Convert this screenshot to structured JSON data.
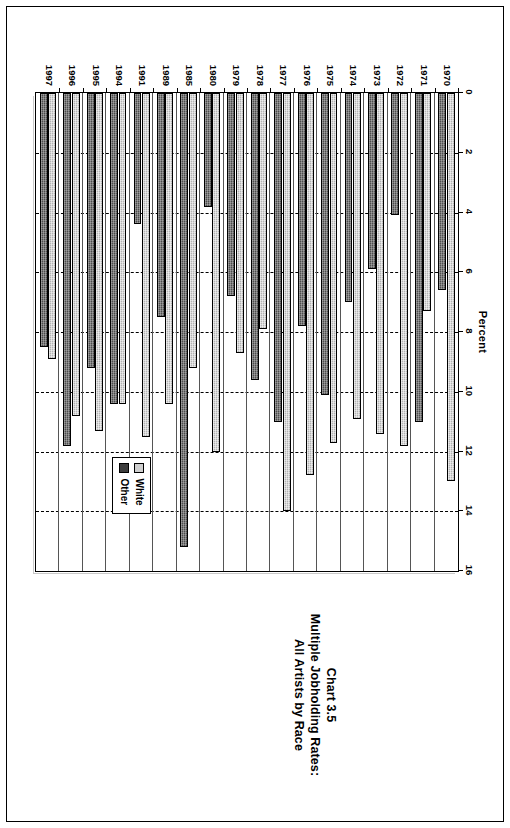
{
  "chart_data": {
    "type": "bar",
    "orientation": "horizontal",
    "title": "Chart 3.5\nMultiple Jobholding Rates:\nAll Artists by Race",
    "title_lines": [
      "Chart 3.5",
      "Multiple Jobholding Rates:",
      "All Artists by Race"
    ],
    "xlabel": "Percent",
    "ylabel": "",
    "xlim": [
      0,
      16
    ],
    "xticks": [
      0,
      2,
      4,
      6,
      8,
      10,
      12,
      14,
      16
    ],
    "xtick_labels": [
      "0",
      "2",
      "4",
      "6",
      "8",
      "10",
      "12",
      "14",
      "16"
    ],
    "grid": true,
    "grid_axis": "x",
    "grid_style": "dashed",
    "legend_position": "inside-lower-right",
    "categories": [
      "1970",
      "1971",
      "1972",
      "1973",
      "1974",
      "1975",
      "1976",
      "1977",
      "1978",
      "1979",
      "1980",
      "1985",
      "1989",
      "1991",
      "1994",
      "1995",
      "1996",
      "1997"
    ],
    "series": [
      {
        "name": "White",
        "color": "#b3b3b3",
        "values": [
          13.0,
          7.3,
          11.8,
          11.4,
          10.9,
          11.7,
          12.8,
          14.0,
          7.9,
          8.7,
          12.0,
          9.2,
          10.4,
          11.5,
          10.4,
          11.3,
          10.8,
          8.9
        ]
      },
      {
        "name": "Other",
        "color": "#4d4d4d",
        "values": [
          6.6,
          11.0,
          4.1,
          5.9,
          7.0,
          10.1,
          7.8,
          11.0,
          9.6,
          6.8,
          3.8,
          15.2,
          7.5,
          4.4,
          10.4,
          9.2,
          11.8,
          8.5
        ]
      }
    ]
  },
  "chart": {
    "title": {
      "line1": "Chart 3.5",
      "line2": "Multiple Jobholding Rates:",
      "line3": "All Artists by Race"
    },
    "axis": {
      "x_title": "Percent"
    },
    "legend": {
      "items": [
        {
          "label": "White"
        },
        {
          "label": "Other"
        }
      ]
    }
  }
}
